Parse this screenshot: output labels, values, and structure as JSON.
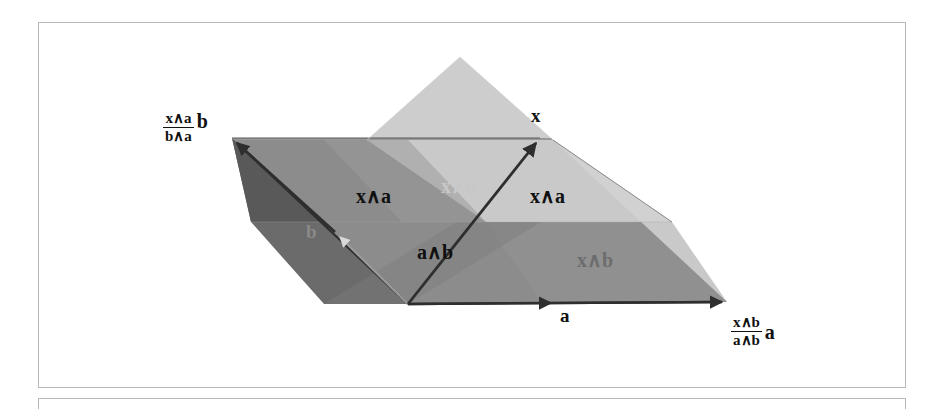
{
  "figure": {
    "caption_box_present": true,
    "palette": {
      "dark_left": "#595959",
      "dark_mid": "#6b6b6b",
      "mid_gray": "#8c8c8c",
      "mid_gray_2": "#979797",
      "light_gray": "#c0c0c0",
      "lighter_gray": "#cdcdcd",
      "lightest_gray": "#d9d9d9",
      "outline": "#3a3a3a",
      "box_border": "#b9b9b9",
      "background": "#ffffff"
    },
    "vectors": [
      {
        "name": "vector-a",
        "label": "a",
        "x": 560,
        "y": 312,
        "origin": [
          408,
          304
        ],
        "tip": [
          727,
          302
        ]
      },
      {
        "name": "vector-b",
        "label": "b",
        "x": 306,
        "y": 226,
        "origin": [
          408,
          304
        ],
        "tip": [
          232,
          138
        ]
      },
      {
        "name": "vector-x",
        "label": "x",
        "x": 531,
        "y": 108,
        "origin": [
          408,
          304
        ],
        "tip": [
          540,
          138
        ]
      }
    ],
    "region_labels": [
      {
        "name": "region-label-x-wedge-b-top",
        "text": "x∧b",
        "x": 441,
        "y": 178,
        "tone": "light"
      },
      {
        "name": "region-label-x-wedge-a-left",
        "text": "x∧a",
        "x": 356,
        "y": 188,
        "tone": "dark"
      },
      {
        "name": "region-label-x-wedge-a-right",
        "text": "x∧a",
        "x": 530,
        "y": 188,
        "tone": "dark"
      },
      {
        "name": "region-label-a-wedge-b",
        "text": "a∧b",
        "x": 417,
        "y": 244,
        "tone": "dark"
      },
      {
        "name": "region-label-x-wedge-b-bottom",
        "text": "x∧b",
        "x": 577,
        "y": 252,
        "tone": "mid"
      }
    ],
    "fractions": [
      {
        "name": "fraction-label-b",
        "numerator": "x∧a",
        "denominator": "b∧a",
        "coefficient": "b",
        "x": 163,
        "y": 114
      },
      {
        "name": "fraction-label-a",
        "numerator": "x∧b",
        "denominator": "a∧b",
        "coefficient": "a",
        "x": 731,
        "y": 320
      }
    ]
  }
}
